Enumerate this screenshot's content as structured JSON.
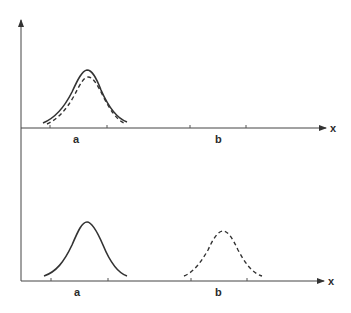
{
  "diagram": {
    "type": "distribution-sketch",
    "panels": [
      {
        "name": "top",
        "x_axis_label": "x",
        "x_markers": [
          {
            "label": "a"
          },
          {
            "label": "b"
          }
        ],
        "curves": [
          {
            "style": "solid",
            "center": "a",
            "description": "Gaussian peak near a"
          },
          {
            "style": "dashed",
            "center": "a",
            "description": "Slightly lower Gaussian peak near a, overlapping solid"
          }
        ]
      },
      {
        "name": "bottom",
        "x_axis_label": "x",
        "x_markers": [
          {
            "label": "a"
          },
          {
            "label": "b"
          }
        ],
        "curves": [
          {
            "style": "solid",
            "center": "a",
            "description": "Gaussian peak near a"
          },
          {
            "style": "dashed",
            "center": "b",
            "description": "Gaussian peak near b (shifted)"
          }
        ]
      }
    ],
    "colors": {
      "line": "#333333",
      "background": "#ffffff"
    }
  },
  "labels": {
    "top_x": "x",
    "top_a": "a",
    "top_b": "b",
    "bottom_x": "x",
    "bottom_a": "a",
    "bottom_b": "b"
  }
}
